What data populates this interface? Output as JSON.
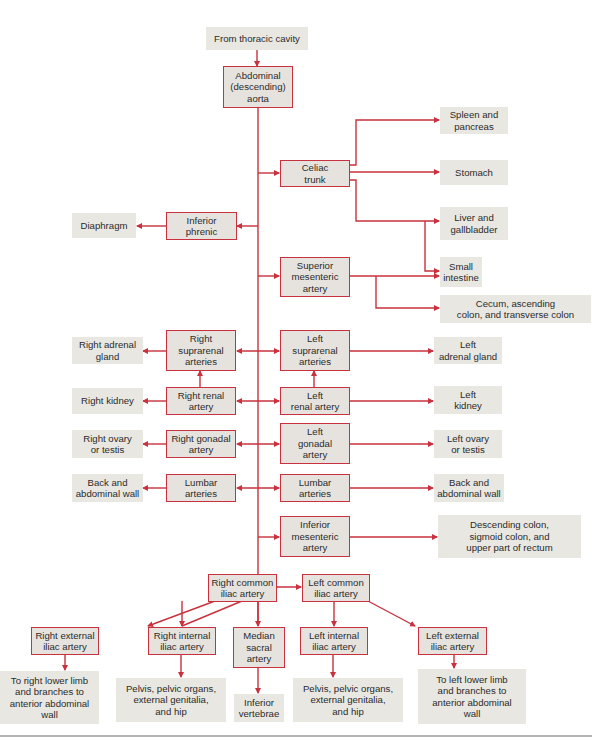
{
  "diagram": {
    "colors": {
      "artery_border": "#c8313d",
      "artery_fill": "#e6e3df",
      "target_fill": "#e8e7e2",
      "line": "#c8313d"
    },
    "source": "From thoracic cavity",
    "aorta": "Abdominal\n(descending)\naorta",
    "celiac": {
      "label": "Celiac\ntrunk",
      "targets": [
        "Spleen and\npancreas",
        "Stomach",
        "Liver and\ngallbladder"
      ]
    },
    "inferior_phrenic": {
      "label": "Inferior\nphrenic",
      "target": "Diaphragm"
    },
    "superior_mesenteric": {
      "label": "Superior\nmesenteric\nartery",
      "targets": [
        "Small\nintestine",
        "Cecum, ascending\ncolon, and transverse colon"
      ]
    },
    "paired": {
      "suprarenal": {
        "right": "Right\nsuprarenal\narteries",
        "left": "Left\nsuprarenal\narteries",
        "right_target": "Right adrenal\ngland",
        "left_target": "Left\nadrenal gland"
      },
      "renal": {
        "right": "Right renal\nartery",
        "left": "Left\nrenal artery",
        "right_target": "Right kidney",
        "left_target": "Left\nkidney"
      },
      "gonadal": {
        "right": "Right gonadal\nartery",
        "left": "Left\ngonadal\nartery",
        "right_target": "Right ovary\nor testis",
        "left_target": "Left ovary\nor testis"
      },
      "lumbar": {
        "right": "Lumbar\narteries",
        "left": "Lumbar\narteries",
        "right_target": "Back and\nabdominal wall",
        "left_target": "Back and\nabdominal wall"
      }
    },
    "inferior_mesenteric": {
      "label": "Inferior\nmesenteric\nartery",
      "target": "Descending colon,\nsigmoid colon, and\nupper part of rectum"
    },
    "common_iliac": {
      "right": "Right common\niliac artery",
      "left": "Left common\niliac artery"
    },
    "iliac_branches": {
      "right_external": "Right external\niliac artery",
      "right_internal": "Right internal\niliac artery",
      "median_sacral": "Median\nsacral\nartery",
      "left_internal": "Left internal\niliac artery",
      "left_external": "Left external\niliac artery"
    },
    "iliac_targets": {
      "right_external": "To right lower limb\nand branches to\nanterior abdominal\nwall",
      "right_internal": "Pelvis, pelvic organs,\nexternal genitalia,\nand hip",
      "median_sacral": "Inferior\nvertebrae",
      "left_internal": "Pelvis, pelvic organs,\nexternal genitalia,\nand hip",
      "left_external": "To left lower limb\nand branches to\nanterior abdominal\nwall"
    }
  }
}
